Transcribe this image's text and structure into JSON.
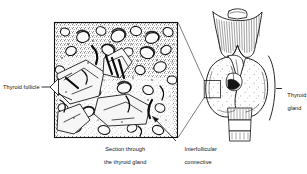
{
  "figure": {
    "domain": "anatomy-histology-diagram",
    "background_color": "#ffffff",
    "ink_color": "#111111",
    "labels": {
      "thyroid_follicle": "Thyroid follicle",
      "section_caption_line1": "Section through",
      "section_caption_line2": "the thyroid gland",
      "interfollicular_line1": "Interfollicular",
      "interfollicular_line2": "connective",
      "interfollicular_line3": "tissue",
      "thyroid_gland_line1": "Thyroid",
      "thyroid_gland_line2": "gland"
    },
    "panels": {
      "micrograph": {
        "name": "Section through the thyroid gland",
        "type": "histological-micrograph",
        "frame": {
          "x": 54,
          "y": 22,
          "width": 124,
          "height": 116
        },
        "border_color": "#111111"
      },
      "anatomical": {
        "name": "Larynx and thyroid gland anterior view",
        "type": "line-drawing",
        "structures": [
          "hyoid-bone",
          "thyrohyoid-membrane",
          "thyroid-cartilage",
          "cricothyroid-muscle",
          "thyroid-gland-right-lobe",
          "thyroid-gland-left-lobe",
          "thyroid-isthmus",
          "trachea-rings"
        ]
      },
      "inset_box": {
        "x": 204,
        "y": 80,
        "width": 16,
        "height": 18
      }
    },
    "annotations": {
      "magnification_leaders": 2,
      "follicle_pointer": "wedge-bracket",
      "interfollicular_pointer": "arrow",
      "gland_brace": "curly-brace-right"
    }
  }
}
